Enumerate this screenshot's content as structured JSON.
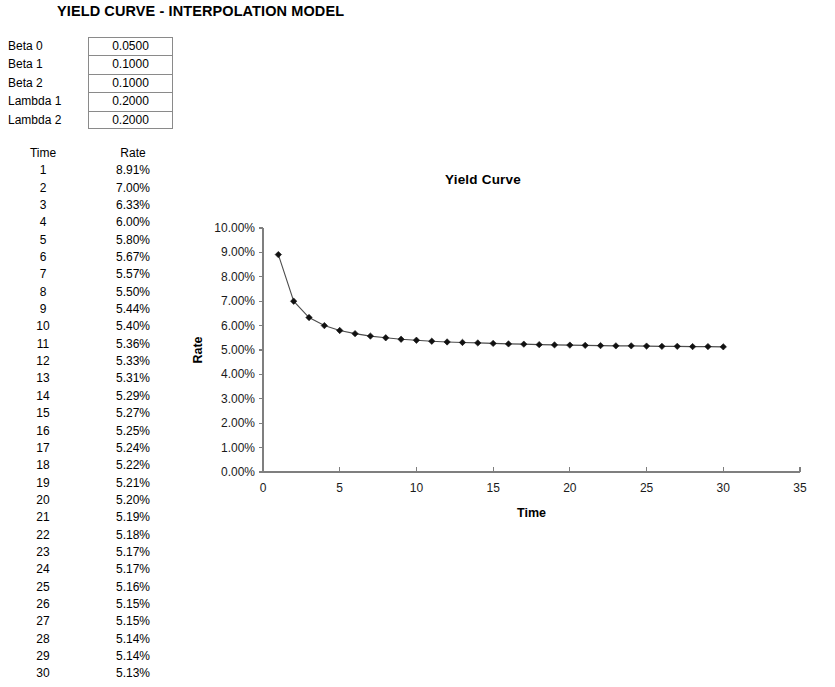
{
  "page_title": "YIELD CURVE - INTERPOLATION MODEL",
  "parameters": [
    {
      "label": "Beta 0",
      "value": "0.0500"
    },
    {
      "label": "Beta 1",
      "value": "0.1000"
    },
    {
      "label": "Beta 2",
      "value": "0.1000"
    },
    {
      "label": "Lambda 1",
      "value": "0.2000"
    },
    {
      "label": "Lambda 2",
      "value": "0.2000"
    }
  ],
  "table": {
    "headers": [
      "Time",
      "Rate"
    ],
    "rows": [
      [
        "1",
        "8.91%"
      ],
      [
        "2",
        "7.00%"
      ],
      [
        "3",
        "6.33%"
      ],
      [
        "4",
        "6.00%"
      ],
      [
        "5",
        "5.80%"
      ],
      [
        "6",
        "5.67%"
      ],
      [
        "7",
        "5.57%"
      ],
      [
        "8",
        "5.50%"
      ],
      [
        "9",
        "5.44%"
      ],
      [
        "10",
        "5.40%"
      ],
      [
        "11",
        "5.36%"
      ],
      [
        "12",
        "5.33%"
      ],
      [
        "13",
        "5.31%"
      ],
      [
        "14",
        "5.29%"
      ],
      [
        "15",
        "5.27%"
      ],
      [
        "16",
        "5.25%"
      ],
      [
        "17",
        "5.24%"
      ],
      [
        "18",
        "5.22%"
      ],
      [
        "19",
        "5.21%"
      ],
      [
        "20",
        "5.20%"
      ],
      [
        "21",
        "5.19%"
      ],
      [
        "22",
        "5.18%"
      ],
      [
        "23",
        "5.17%"
      ],
      [
        "24",
        "5.17%"
      ],
      [
        "25",
        "5.16%"
      ],
      [
        "26",
        "5.15%"
      ],
      [
        "27",
        "5.15%"
      ],
      [
        "28",
        "5.14%"
      ],
      [
        "29",
        "5.14%"
      ],
      [
        "30",
        "5.13%"
      ]
    ]
  },
  "chart_data": {
    "type": "line",
    "title": "Yield Curve",
    "xlabel": "Time",
    "ylabel": "Rate",
    "x": [
      1,
      2,
      3,
      4,
      5,
      6,
      7,
      8,
      9,
      10,
      11,
      12,
      13,
      14,
      15,
      16,
      17,
      18,
      19,
      20,
      21,
      22,
      23,
      24,
      25,
      26,
      27,
      28,
      29,
      30
    ],
    "values": [
      8.91,
      7.0,
      6.33,
      6.0,
      5.8,
      5.67,
      5.57,
      5.5,
      5.44,
      5.4,
      5.36,
      5.33,
      5.31,
      5.29,
      5.27,
      5.25,
      5.24,
      5.22,
      5.21,
      5.2,
      5.19,
      5.18,
      5.17,
      5.17,
      5.16,
      5.15,
      5.15,
      5.14,
      5.14,
      5.13
    ],
    "series": [
      {
        "name": "Rate",
        "values": [
          8.91,
          7.0,
          6.33,
          6.0,
          5.8,
          5.67,
          5.57,
          5.5,
          5.44,
          5.4,
          5.36,
          5.33,
          5.31,
          5.29,
          5.27,
          5.25,
          5.24,
          5.22,
          5.21,
          5.2,
          5.19,
          5.18,
          5.17,
          5.17,
          5.16,
          5.15,
          5.15,
          5.14,
          5.14,
          5.13
        ]
      }
    ],
    "xlim": [
      0,
      35
    ],
    "ylim": [
      0,
      10
    ],
    "xticks": [
      0,
      5,
      10,
      15,
      20,
      25,
      30,
      35
    ],
    "xtick_labels": [
      "0",
      "5",
      "10",
      "15",
      "20",
      "25",
      "30",
      "35"
    ],
    "yticks": [
      0,
      1,
      2,
      3,
      4,
      5,
      6,
      7,
      8,
      9,
      10
    ],
    "ytick_labels": [
      "0.00%",
      "1.00%",
      "2.00%",
      "3.00%",
      "4.00%",
      "5.00%",
      "6.00%",
      "7.00%",
      "8.00%",
      "9.00%",
      "10.00%"
    ],
    "grid": false,
    "legend": false,
    "marker": "diamond",
    "line_color": "#4d4d4d",
    "marker_color": "#111111"
  }
}
